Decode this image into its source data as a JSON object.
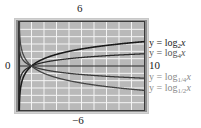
{
  "chart_data": {
    "type": "line",
    "title": "",
    "window": {
      "xmin": 0,
      "xmax": 10,
      "ymin": -6,
      "ymax": 6
    },
    "tick_labels": {
      "top": "6",
      "bottom": "-6",
      "left": "0",
      "right": "10"
    },
    "xlabel": "",
    "ylabel": "",
    "grid": true,
    "legend_position": "right",
    "series": [
      {
        "name": "y = log2 x",
        "base": 2,
        "color": "#1a1a1a",
        "x": [
          0.1,
          0.5,
          1,
          2,
          4,
          6,
          8,
          10
        ],
        "values": [
          -3.32,
          -1,
          0,
          1,
          2,
          2.58,
          3,
          3.32
        ]
      },
      {
        "name": "y = log4 x",
        "base": 4,
        "color": "#2a2a2a",
        "x": [
          0.1,
          0.5,
          1,
          2,
          4,
          6,
          8,
          10
        ],
        "values": [
          -1.66,
          -0.5,
          0,
          0.5,
          1,
          1.29,
          1.5,
          1.66
        ]
      },
      {
        "name": "y = log1/4 x",
        "base": 0.25,
        "color": "#3a3a3a",
        "x": [
          0.1,
          0.5,
          1,
          2,
          4,
          6,
          8,
          10
        ],
        "values": [
          1.66,
          0.5,
          0,
          -0.5,
          -1,
          -1.29,
          -1.5,
          -1.66
        ]
      },
      {
        "name": "y = log1/2 x",
        "base": 0.5,
        "color": "#444444",
        "x": [
          0.1,
          0.5,
          1,
          2,
          4,
          6,
          8,
          10
        ],
        "values": [
          3.32,
          1,
          0,
          -1,
          -2,
          -2.58,
          -3,
          -3.32
        ]
      }
    ]
  },
  "labels": {
    "ymax": "6",
    "ymin": "−6",
    "xmin": "0",
    "xmax": "10"
  },
  "legend": [
    {
      "prefix": "y = log",
      "sub": "2",
      "var": "x",
      "tone": "dark"
    },
    {
      "prefix": "y = log",
      "sub": "4",
      "var": "x",
      "tone": "gray-dark"
    },
    {
      "prefix": "y = log",
      "sub": "1/4",
      "var": "x",
      "tone": "gray"
    },
    {
      "prefix": "y = log",
      "sub": "1/2",
      "var": "x",
      "tone": "gray"
    }
  ],
  "colors": {
    "plot_background": "#b9b9b9",
    "grid": "#f2f2f2",
    "frame_outer": "#cfcfcf",
    "frame_mid": "#8c8c8c",
    "frame_inner": "#3a3a3a",
    "curve": "#1e1e1e"
  }
}
